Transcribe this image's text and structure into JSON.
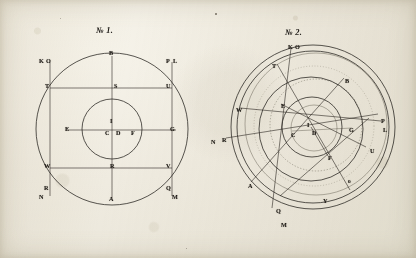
{
  "plate": {
    "medium": "engraving on aged paper",
    "ink_color": "#23201c",
    "paper_color": "#efece2"
  },
  "figures": [
    {
      "id": "fig-1",
      "title": "№ 1.",
      "title_x": 96,
      "title_y": 26,
      "center": {
        "x": 112,
        "y": 129
      },
      "circles": [
        {
          "name": "outer-circle",
          "cx": 112,
          "cy": 129,
          "r": 76
        },
        {
          "name": "inner-circle",
          "cx": 112,
          "cy": 129,
          "r": 30
        }
      ],
      "lines": [
        {
          "name": "vertical-axis-BA",
          "x1": 112,
          "y1": 56,
          "x2": 112,
          "y2": 198
        },
        {
          "name": "horizontal-axis-EG",
          "x1": 66,
          "y1": 130,
          "x2": 176,
          "y2": 130
        },
        {
          "name": "chord-KN-left",
          "x1": 50,
          "y1": 62,
          "x2": 50,
          "y2": 196
        },
        {
          "name": "chord-PM-right",
          "x1": 172,
          "y1": 62,
          "x2": 172,
          "y2": 196
        },
        {
          "name": "chord-TU-upper",
          "x1": 50,
          "y1": 88,
          "x2": 172,
          "y2": 88
        },
        {
          "name": "chord-WV-lower",
          "x1": 50,
          "y1": 168,
          "x2": 172,
          "y2": 168
        }
      ],
      "labels": [
        {
          "text": "B",
          "x": 109,
          "y": 50,
          "name": "label-b"
        },
        {
          "text": "K",
          "x": 39,
          "y": 58,
          "name": "label-k"
        },
        {
          "text": "O",
          "x": 46,
          "y": 58,
          "name": "label-o"
        },
        {
          "text": "P",
          "x": 166,
          "y": 58,
          "name": "label-p"
        },
        {
          "text": "L",
          "x": 173,
          "y": 58,
          "name": "label-l"
        },
        {
          "text": "T",
          "x": 45,
          "y": 83,
          "name": "label-t"
        },
        {
          "text": "S",
          "x": 114,
          "y": 83,
          "name": "label-s"
        },
        {
          "text": "U",
          "x": 166,
          "y": 83,
          "name": "label-u"
        },
        {
          "text": "E",
          "x": 65,
          "y": 126,
          "name": "label-e"
        },
        {
          "text": "I",
          "x": 110,
          "y": 118,
          "name": "label-i"
        },
        {
          "text": "C",
          "x": 105,
          "y": 130,
          "name": "label-c"
        },
        {
          "text": "D",
          "x": 116,
          "y": 130,
          "name": "label-d"
        },
        {
          "text": "F",
          "x": 131,
          "y": 130,
          "name": "label-f"
        },
        {
          "text": "G",
          "x": 170,
          "y": 126,
          "name": "label-g"
        },
        {
          "text": "W",
          "x": 44,
          "y": 163,
          "name": "label-w"
        },
        {
          "text": "R",
          "x": 110,
          "y": 163,
          "name": "label-r"
        },
        {
          "text": "V",
          "x": 166,
          "y": 163,
          "name": "label-v"
        },
        {
          "text": "R",
          "x": 44,
          "y": 185,
          "name": "label-r2"
        },
        {
          "text": "N",
          "x": 39,
          "y": 194,
          "name": "label-n"
        },
        {
          "text": "Q",
          "x": 166,
          "y": 185,
          "name": "label-q"
        },
        {
          "text": "M",
          "x": 172,
          "y": 194,
          "name": "label-m"
        },
        {
          "text": "A",
          "x": 109,
          "y": 196,
          "name": "label-a"
        }
      ]
    },
    {
      "id": "fig-2",
      "title": "№ 2.",
      "title_x": 285,
      "title_y": 28,
      "center": {
        "x": 313,
        "y": 127
      },
      "circles": [
        {
          "name": "outermost-circle",
          "cx": 313,
          "cy": 127,
          "r": 82
        },
        {
          "name": "second-circle",
          "cx": 313,
          "cy": 127,
          "r": 76
        },
        {
          "name": "tilted-circle",
          "cx": 316,
          "cy": 124,
          "r": 71
        },
        {
          "name": "mid-circle",
          "cx": 311,
          "cy": 129,
          "r": 52
        },
        {
          "name": "dotted-circle",
          "cx": 316,
          "cy": 125,
          "r": 46
        },
        {
          "name": "inner-circle",
          "cx": 312,
          "cy": 127,
          "r": 30
        },
        {
          "name": "innermost-circle",
          "cx": 314,
          "cy": 128,
          "r": 23
        }
      ],
      "lines": [
        {
          "name": "diagonal-K-M",
          "x1": 291,
          "y1": 48,
          "x2": 272,
          "y2": 208
        },
        {
          "name": "diagonal-T-Y",
          "x1": 277,
          "y1": 64,
          "x2": 350,
          "y2": 190
        },
        {
          "name": "diagonal-B-A",
          "x1": 344,
          "y1": 78,
          "x2": 251,
          "y2": 182
        },
        {
          "name": "diagonal-W-L",
          "x1": 240,
          "y1": 108,
          "x2": 381,
          "y2": 121
        },
        {
          "name": "diagonal-R-P",
          "x1": 226,
          "y1": 138,
          "x2": 378,
          "y2": 114
        },
        {
          "name": "diagonal-E-U",
          "x1": 281,
          "y1": 104,
          "x2": 366,
          "y2": 147
        },
        {
          "name": "diagonal-Q-O",
          "x1": 280,
          "y1": 196,
          "x2": 369,
          "y2": 118
        },
        {
          "name": "radius-C-G",
          "x1": 292,
          "y1": 131,
          "x2": 352,
          "y2": 128
        },
        {
          "name": "radius-D-F",
          "x1": 311,
          "y1": 127,
          "x2": 328,
          "y2": 156
        }
      ],
      "labels": [
        {
          "text": "K",
          "x": 288,
          "y": 44,
          "name": "label2-k"
        },
        {
          "text": "O",
          "x": 295,
          "y": 44,
          "name": "label2-o"
        },
        {
          "text": "T",
          "x": 272,
          "y": 63,
          "name": "label2-t"
        },
        {
          "text": "B",
          "x": 345,
          "y": 78,
          "name": "label2-b"
        },
        {
          "text": "W",
          "x": 236,
          "y": 107,
          "name": "label2-w"
        },
        {
          "text": "E",
          "x": 281,
          "y": 103,
          "name": "label2-e"
        },
        {
          "text": "P",
          "x": 381,
          "y": 118,
          "name": "label2-p"
        },
        {
          "text": "N",
          "x": 211,
          "y": 139,
          "name": "label2-n"
        },
        {
          "text": "R",
          "x": 222,
          "y": 137,
          "name": "label2-r"
        },
        {
          "text": "I",
          "x": 307,
          "y": 122,
          "name": "label2-i"
        },
        {
          "text": "C",
          "x": 291,
          "y": 132,
          "name": "label2-c"
        },
        {
          "text": "D",
          "x": 312,
          "y": 130,
          "name": "label2-d"
        },
        {
          "text": "G",
          "x": 349,
          "y": 127,
          "name": "label2-g"
        },
        {
          "text": "L",
          "x": 383,
          "y": 127,
          "name": "label2-l"
        },
        {
          "text": "F",
          "x": 328,
          "y": 155,
          "name": "label2-f"
        },
        {
          "text": "U",
          "x": 370,
          "y": 148,
          "name": "label2-u"
        },
        {
          "text": "A",
          "x": 248,
          "y": 183,
          "name": "label2-a"
        },
        {
          "text": "o",
          "x": 348,
          "y": 179,
          "name": "label2-o-small"
        },
        {
          "text": "Y",
          "x": 323,
          "y": 198,
          "name": "label2-y"
        },
        {
          "text": "Q",
          "x": 276,
          "y": 208,
          "name": "label2-q"
        },
        {
          "text": "M",
          "x": 281,
          "y": 222,
          "name": "label2-m"
        }
      ]
    }
  ]
}
